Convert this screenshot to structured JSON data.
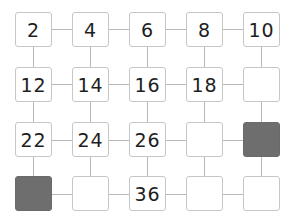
{
  "puzzle": {
    "description": "Number grid counting by 2s",
    "rows": [
      [
        {
          "value": "2"
        },
        {
          "value": "4"
        },
        {
          "value": "6"
        },
        {
          "value": "8"
        },
        {
          "value": "10"
        }
      ],
      [
        {
          "value": "12"
        },
        {
          "value": "14"
        },
        {
          "value": "16"
        },
        {
          "value": "18"
        },
        {
          "value": ""
        }
      ],
      [
        {
          "value": "22"
        },
        {
          "value": "24"
        },
        {
          "value": "26"
        },
        {
          "value": ""
        },
        {
          "value": "",
          "shaded": true
        }
      ],
      [
        {
          "value": "",
          "shaded": true
        },
        {
          "value": ""
        },
        {
          "value": "36"
        },
        {
          "value": ""
        },
        {
          "value": ""
        }
      ]
    ],
    "colors": {
      "cell_border": "#c6c6c6",
      "shaded_fill": "#6e6e6e",
      "connector": "#b8b8b8",
      "text": "#1e1e1e"
    }
  }
}
